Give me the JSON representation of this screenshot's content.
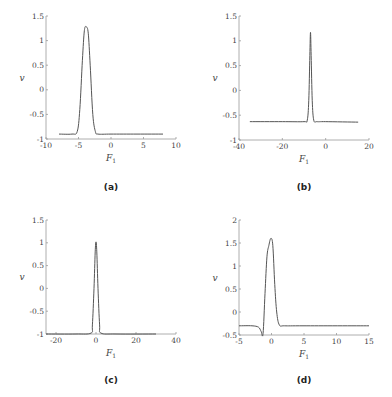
{
  "chart_data": [
    {
      "panel": "(a)",
      "type": "line",
      "xlabel": "F1",
      "ylabel": "v",
      "xlim": [
        -10,
        10
      ],
      "ylim": [
        -1,
        1.5
      ],
      "xticks": [
        -10,
        -5,
        0,
        5,
        10
      ],
      "yticks": [
        -1,
        -0.5,
        0,
        0.5,
        1,
        1.5
      ],
      "grid": false,
      "series": [
        {
          "name": "v",
          "x": [
            -8,
            -6,
            -5.2,
            -4.8,
            -4.4,
            -4.1,
            -3.8,
            -3.5,
            -3.2,
            -2.8,
            -2.4,
            -2,
            0,
            4,
            8
          ],
          "y": [
            -0.9,
            -0.9,
            -0.85,
            -0.4,
            0.6,
            1.2,
            1.28,
            1.15,
            0.5,
            -0.5,
            -0.85,
            -0.9,
            -0.9,
            -0.9,
            -0.9
          ]
        }
      ]
    },
    {
      "panel": "(b)",
      "type": "line",
      "xlabel": "F1",
      "ylabel": "v",
      "xlim": [
        -40,
        20
      ],
      "ylim": [
        -1,
        1.5
      ],
      "xticks": [
        -40,
        -20,
        0,
        20
      ],
      "yticks": [
        -1,
        -0.5,
        0,
        0.5,
        1,
        1.5
      ],
      "grid": false,
      "series": [
        {
          "name": "v",
          "x": [
            -35,
            -20,
            -10,
            -8.5,
            -7.8,
            -7.3,
            -7,
            -6.7,
            -6.2,
            -5.5,
            -4,
            0,
            15
          ],
          "y": [
            -0.63,
            -0.63,
            -0.63,
            -0.6,
            -0.2,
            0.7,
            1.17,
            0.7,
            -0.2,
            -0.6,
            -0.63,
            -0.63,
            -0.64
          ]
        }
      ]
    },
    {
      "panel": "(c)",
      "type": "line",
      "xlabel": "F1",
      "ylabel": "v",
      "xlim": [
        -25,
        40
      ],
      "ylim": [
        -1,
        1.5
      ],
      "xticks": [
        -20,
        0,
        20,
        40
      ],
      "yticks": [
        -1,
        -0.5,
        0,
        0.5,
        1,
        1.5
      ],
      "grid": false,
      "series": [
        {
          "name": "v",
          "x": [
            -25,
            -10,
            -2.5,
            -1.8,
            -1,
            -0.4,
            0,
            0.4,
            1,
            1.8,
            2.5,
            10,
            30
          ],
          "y": [
            -1,
            -1,
            -0.98,
            -0.8,
            0,
            0.8,
            1.02,
            0.8,
            0,
            -0.8,
            -0.98,
            -1,
            -1
          ]
        }
      ]
    },
    {
      "panel": "(d)",
      "type": "line",
      "xlabel": "F1",
      "ylabel": "v",
      "xlim": [
        -5,
        15
      ],
      "ylim": [
        -0.5,
        2
      ],
      "xticks": [
        -5,
        0,
        5,
        10,
        15
      ],
      "yticks": [
        -0.5,
        0,
        0.5,
        1,
        1.5,
        2
      ],
      "grid": false,
      "series": [
        {
          "name": "v",
          "x": [
            -5,
            -3,
            -2,
            -1.6,
            -1.3,
            -1,
            -0.7,
            -0.4,
            -0.1,
            0.2,
            0.5,
            0.8,
            1.2,
            2,
            5,
            15
          ],
          "y": [
            -0.3,
            -0.3,
            -0.33,
            -0.42,
            -0.47,
            0.4,
            1.2,
            1.45,
            1.6,
            1.45,
            0.6,
            0.0,
            -0.28,
            -0.3,
            -0.3,
            -0.3
          ]
        }
      ]
    }
  ],
  "captions": [
    "(a)",
    "(b)",
    "(c)",
    "(d)"
  ],
  "axis_labels": {
    "x": "F",
    "x_sub": "1",
    "y": "v"
  }
}
